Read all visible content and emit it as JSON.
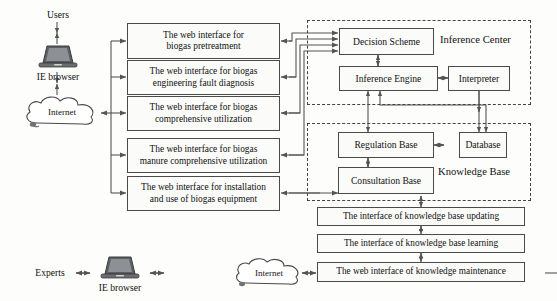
{
  "diagram": {
    "actors": {
      "users_label": "Users",
      "experts_label": "Experts",
      "browser_top_label": "IE browser",
      "browser_bottom_label": "IE browser",
      "internet_top_label": "Internet",
      "internet_bottom_label": "Internet"
    },
    "web_interfaces": [
      {
        "id": "wi1",
        "line1": "The web interface for",
        "line2": "biogas pretreatment"
      },
      {
        "id": "wi2",
        "line1": "The web interface for biogas",
        "line2": "engineering fault diagnosis"
      },
      {
        "id": "wi3",
        "line1": "The web interface for biogas",
        "line2": "comprehensive utilization"
      },
      {
        "id": "wi4",
        "line1": "The web interface for biogas",
        "line2": "manure comprehensive utilization"
      },
      {
        "id": "wi5",
        "line1": "The web interface for installation",
        "line2": "and use of biogas equipment"
      }
    ],
    "inference_center": {
      "group_label": "Inference Center",
      "nodes": [
        {
          "id": "decision_scheme",
          "label": "Decision Scheme"
        },
        {
          "id": "inference_engine",
          "label": "Inference Engine"
        },
        {
          "id": "interpreter",
          "label": "Interpreter"
        }
      ]
    },
    "knowledge_base": {
      "group_label": "Knowledge Base",
      "nodes": [
        {
          "id": "regulation_base",
          "label": "Regulation Base"
        },
        {
          "id": "database",
          "label": "Database"
        },
        {
          "id": "consultation_base",
          "label": "Consultation Base"
        }
      ]
    },
    "maintenance_interfaces": [
      {
        "id": "mi1",
        "label": "The interface of knowledge base updating"
      },
      {
        "id": "mi2",
        "label": "The interface of knowledge base learning"
      },
      {
        "id": "mi3",
        "label": "The web interface of knowledge maintenance"
      }
    ],
    "colors": {
      "node_border": "#4a4a4a",
      "node_fill": "#fbfbfa",
      "group_border": "#444444",
      "connector": "#555555",
      "background": "#fdfdfc",
      "text": "#111111"
    }
  }
}
